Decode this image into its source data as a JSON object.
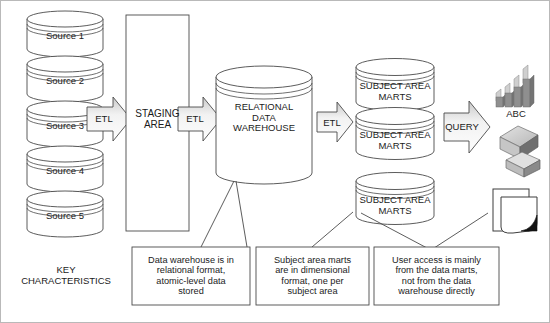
{
  "diagram": {
    "sources": [
      {
        "label": "Source 1"
      },
      {
        "label": "Source 2"
      },
      {
        "label": "Source 3"
      },
      {
        "label": "Source 4"
      },
      {
        "label": "Source 5"
      }
    ],
    "staging": {
      "label": "STAGING\nAREA"
    },
    "warehouse": {
      "label": "RELATIONAL\nDATA\nWAREHOUSE"
    },
    "marts": [
      {
        "label": "SUBJECT AREA\nMARTS"
      },
      {
        "label": "SUBJECT AREA\nMARTS"
      },
      {
        "label": "SUBJECT AREA\nMARTS"
      }
    ],
    "arrows": [
      {
        "label": "ETL",
        "name": "etl-arrow-sources-to-staging"
      },
      {
        "label": "ETL",
        "name": "etl-arrow-staging-to-warehouse"
      },
      {
        "label": "ETL",
        "name": "etl-arrow-warehouse-to-marts"
      },
      {
        "label": "QUERY",
        "name": "query-arrow-marts-to-tools"
      }
    ],
    "output_icons": [
      {
        "name": "bar-chart-icon",
        "label": "ABC"
      },
      {
        "name": "olap-cube-icon",
        "label": ""
      },
      {
        "name": "report-document-icon",
        "label": ""
      }
    ],
    "key_characteristics_label": "KEY\nCHARACTERISTICS",
    "notes": [
      {
        "text": "Data warehouse is in\nrelational format,\natomic-level data\nstored"
      },
      {
        "text": "Subject area marts\nare in dimensional\nformat, one per\nsubject area"
      },
      {
        "text": "User access is mainly\nfrom the data marts,\nnot from the data\nwarehouse directly"
      }
    ],
    "colors": {
      "stroke": "#4a4a4a",
      "text": "#1b1b1b",
      "arrow_fill_light": "#fbfbfb",
      "arrow_fill_dark": "#d2d2d2",
      "icon_dark": "#6b6b6b",
      "icon_mid": "#a6a6a6",
      "icon_light": "#d9d9d9",
      "border": "#b9b9b9"
    }
  }
}
